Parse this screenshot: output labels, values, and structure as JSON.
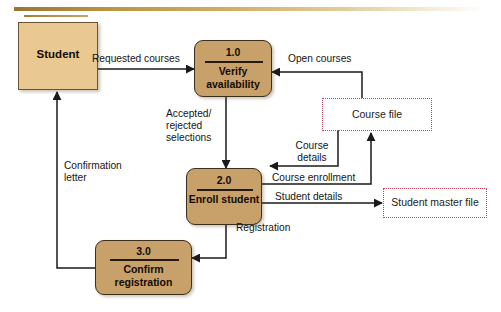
{
  "diagram": {
    "type": "data-flow-diagram",
    "background_color": "#ffffff",
    "palette": {
      "entity_fill": "#e9c891",
      "process_fill": "#c8a06a",
      "process_border": "#3c2f1c",
      "store_border": "#c0485a",
      "flow_line": "#1a1a1a",
      "top_rule": "#b9923f"
    },
    "entities": [
      {
        "id": "student",
        "label": "Student",
        "shape": "rectangle"
      }
    ],
    "processes": [
      {
        "id": "p1",
        "number": "1.0",
        "name": "Verify\navailability",
        "shape": "rounded-rectangle"
      },
      {
        "id": "p2",
        "number": "2.0",
        "name": "Enroll\nstudent",
        "shape": "rounded-rectangle"
      },
      {
        "id": "p3",
        "number": "3.0",
        "name": "Confirm\nregistration",
        "shape": "rounded-rectangle"
      }
    ],
    "data_stores": [
      {
        "id": "course_file",
        "label": "Course file",
        "shape": "open-dotted-rectangle"
      },
      {
        "id": "student_master_file",
        "label": "Student master file",
        "shape": "open-dotted-rectangle"
      }
    ],
    "flows": [
      {
        "id": "f1",
        "label": "Requested courses",
        "from": "student",
        "to": "p1"
      },
      {
        "id": "f2",
        "label": "Open courses",
        "from": "course_file",
        "to": "p1"
      },
      {
        "id": "f3",
        "label": "Accepted/\nrejected\nselections",
        "from": "p1",
        "to": "p2"
      },
      {
        "id": "f4",
        "label": "Course\ndetails",
        "from": "course_file",
        "to": "p2"
      },
      {
        "id": "f5",
        "label": "Course enrollment",
        "from": "p2",
        "to": "course_file"
      },
      {
        "id": "f6",
        "label": "Student details",
        "from": "p2",
        "to": "student_master_file"
      },
      {
        "id": "f7",
        "label": "Registration",
        "from": "p2",
        "to": "p3"
      },
      {
        "id": "f8",
        "label": "Confirmation\nletter",
        "from": "p3",
        "to": "student"
      }
    ]
  }
}
